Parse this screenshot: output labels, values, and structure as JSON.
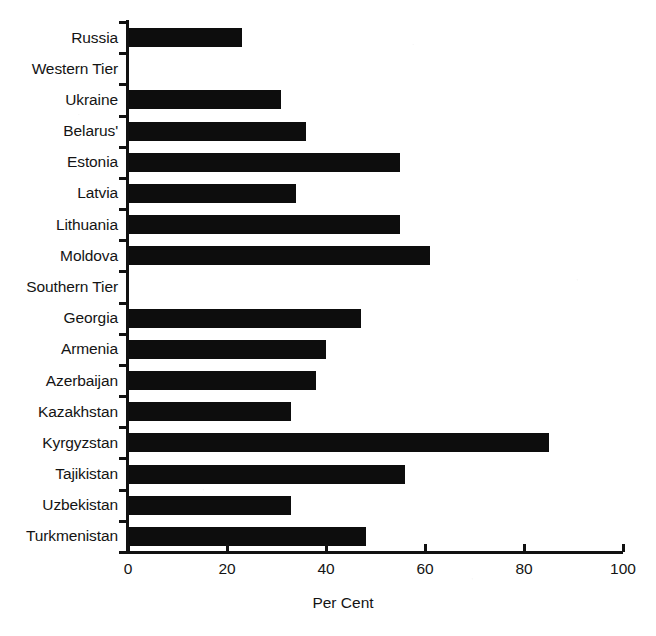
{
  "chart_data": {
    "type": "bar",
    "orientation": "horizontal",
    "title": "",
    "xlabel": "Per Cent",
    "ylabel": "",
    "xlim": [
      0,
      100
    ],
    "xticks": [
      0,
      20,
      40,
      60,
      80,
      100
    ],
    "xtick_labels": [
      "0",
      "20",
      "40",
      "60",
      "80",
      "100"
    ],
    "grid": false,
    "legend": null,
    "bar_color": "#0d0d0d",
    "background_color": "#ffffff",
    "categories": [
      "Russia",
      "Western Tier",
      "Ukraine",
      "Belarus'",
      "Estonia",
      "Latvia",
      "Lithuania",
      "Moldova",
      "Southern Tier",
      "Georgia",
      "Armenia",
      "Azerbaijan",
      "Kazakhstan",
      "Kyrgyzstan",
      "Tajikistan",
      "Uzbekistan",
      "Turkmenistan"
    ],
    "values": [
      23,
      null,
      31,
      36,
      55,
      34,
      55,
      61,
      null,
      47,
      40,
      38,
      33,
      85,
      56,
      33,
      48
    ],
    "group_headers": [
      "Western Tier",
      "Southern Tier"
    ]
  }
}
